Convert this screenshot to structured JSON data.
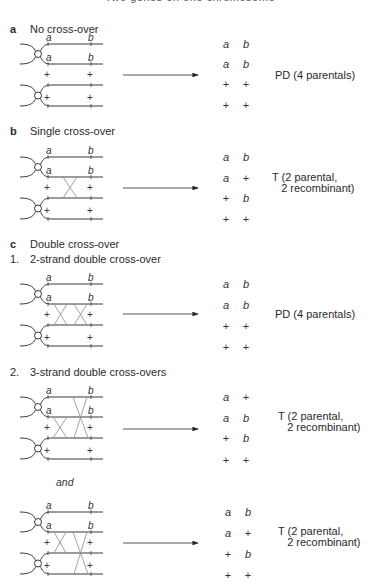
{
  "header": {
    "title": "Two genes on one chromosome"
  },
  "sections": [
    {
      "id": "a",
      "letter": "a",
      "title": "No cross-over",
      "rows": [
        [
          "a",
          "b"
        ],
        [
          "a",
          "b"
        ],
        [
          "+",
          "+"
        ],
        [
          "+",
          "+"
        ]
      ],
      "result": "PD (4 parentals)"
    },
    {
      "id": "b",
      "letter": "b",
      "title": "Single cross-over",
      "rows": [
        [
          "a",
          "b"
        ],
        [
          "a",
          "+"
        ],
        [
          "+",
          "b"
        ],
        [
          "+",
          "+"
        ]
      ],
      "result": "T (2 parental,\n   2 recombinant)"
    },
    {
      "id": "c",
      "letter": "c",
      "title": "Double cross-over",
      "subsections": [
        {
          "number": "1.",
          "title": "2-strand double cross-over",
          "rows": [
            [
              "a",
              "b"
            ],
            [
              "a",
              "b"
            ],
            [
              "+",
              "+"
            ],
            [
              "+",
              "+"
            ]
          ],
          "result": "PD (4 parentals)"
        },
        {
          "number": "2.",
          "title": "3-strand double cross-overs",
          "rows": [
            [
              "a",
              "+"
            ],
            [
              "a",
              "b"
            ],
            [
              "+",
              "b"
            ],
            [
              "+",
              "+"
            ]
          ],
          "result": "T (2 parental,\n   2 recombinant)"
        },
        {
          "connector": "and",
          "rows": [
            [
              "a",
              "b"
            ],
            [
              "a",
              "+"
            ],
            [
              "+",
              "b"
            ],
            [
              "+",
              "+"
            ]
          ],
          "result": "T (2 parental,\n   2 recombinant)"
        }
      ]
    }
  ],
  "chromatid_labels": {
    "top_pair": [
      "a",
      "b"
    ],
    "bottom_pair": [
      "+",
      "+"
    ]
  },
  "colors": {
    "line": "#3a3a3a",
    "cross": "#8a8a8a",
    "text": "#2a2a2a"
  }
}
